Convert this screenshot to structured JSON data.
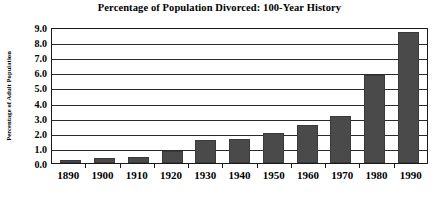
{
  "chart_data": {
    "type": "bar",
    "title": "Percentage of Population Divorced: 100-Year History",
    "xlabel": "",
    "ylabel": "Percentage of Adult Population",
    "categories": [
      "1890",
      "1900",
      "1910",
      "1920",
      "1930",
      "1940",
      "1950",
      "1960",
      "1970",
      "1980",
      "1990"
    ],
    "values": [
      0.2,
      0.3,
      0.4,
      0.8,
      1.5,
      1.6,
      2.0,
      2.5,
      3.1,
      5.8,
      8.7
    ],
    "ylim": [
      0.0,
      9.0
    ],
    "ytick_labels": [
      "0.0",
      "1.0",
      "2.0",
      "3.0",
      "4.0",
      "5.0",
      "6.0",
      "7.0",
      "8.0",
      "9.0"
    ],
    "ytick_values": [
      0.0,
      1.0,
      2.0,
      3.0,
      4.0,
      5.0,
      6.0,
      7.0,
      8.0,
      9.0
    ],
    "grid": true,
    "legend": false,
    "bar_color": "#4a4a4a",
    "plot_background": "#ffffff",
    "gridline_color": "#2b2b2b",
    "axis_color": "#1a1a1a",
    "text_color": "#000000"
  }
}
